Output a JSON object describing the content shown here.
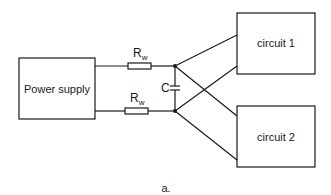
{
  "diagram": {
    "type": "circuit schematic",
    "blocks": {
      "power_supply": {
        "label": "Power supply"
      },
      "circuit_1": {
        "label": "circuit 1"
      },
      "circuit_2": {
        "label": "circuit 2"
      }
    },
    "components": {
      "resistor_top": {
        "symbol": "R",
        "subscript": "w"
      },
      "resistor_bottom": {
        "symbol": "R",
        "subscript": "w"
      },
      "capacitor": {
        "symbol": "C"
      }
    },
    "caption": "a.",
    "colors": {
      "line": "#1a1a1a",
      "background": "#ffffff"
    }
  }
}
